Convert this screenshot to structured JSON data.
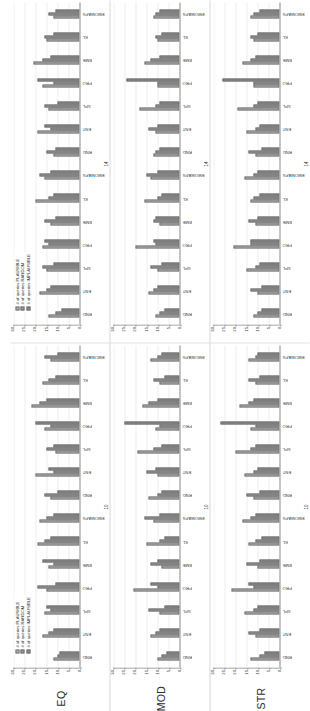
{
  "figure": {
    "legend": {
      "position": "top-left",
      "items": [
        {
          "label": "# of queries PLAUSIBLE",
          "color": "#b9b9b9"
        },
        {
          "label": "# of queries RANDOM",
          "color": "#9a9a9a"
        },
        {
          "label": "# of queries IMPLAUSIBLE",
          "color": "#8d8d8d"
        }
      ]
    },
    "row_labels": [
      "EQ",
      "MOD",
      "STR"
    ],
    "xtitles": [
      "10",
      "14"
    ]
  },
  "chart_data": [
    {
      "id": "eq-left",
      "type": "bar",
      "title": "EQ",
      "xlabel": "10",
      "ylabel": "",
      "ylim": [
        0,
        30
      ],
      "yticks": [
        0,
        5,
        10,
        15,
        20,
        25,
        30
      ],
      "grid": true,
      "legend_position": "top-left",
      "categories": [
        "RND",
        "ENT",
        "SPL",
        "PRO",
        "BME",
        "KL",
        "EMOMAPS",
        "RND",
        "ENT",
        "SPL",
        "PRO",
        "BME",
        "KL",
        "EMOMAPS"
      ],
      "series": [
        {
          "name": "# of queries PLAUSIBLE",
          "values": [
            12,
            17,
            16,
            15,
            14,
            19,
            18,
            13,
            20,
            11,
            16,
            22,
            17,
            13
          ]
        },
        {
          "name": "# of queries RANDOM",
          "values": [
            10,
            14,
            13,
            19,
            12,
            16,
            15,
            16,
            12,
            15,
            13,
            18,
            14,
            16
          ]
        },
        {
          "name": "# of queries IMPLAUSIBLE",
          "values": [
            9,
            12,
            15,
            11,
            17,
            13,
            12,
            10,
            14,
            12,
            20,
            15,
            11,
            10
          ]
        }
      ]
    },
    {
      "id": "eq-right",
      "type": "bar",
      "title": "EQ",
      "xlabel": "14",
      "ylabel": "",
      "ylim": [
        0,
        30
      ],
      "yticks": [
        0,
        5,
        10,
        15,
        20,
        25,
        30
      ],
      "grid": true,
      "legend_position": "top-left",
      "categories": [
        "RND",
        "ENT",
        "SPL",
        "PRO",
        "BME",
        "KL",
        "EMOMAPS",
        "RND",
        "ENT",
        "SPL",
        "PRO",
        "BME",
        "KL",
        "EMOMAPS"
      ],
      "series": [
        {
          "name": "# of queries PLAUSIBLE",
          "values": [
            14,
            18,
            15,
            17,
            13,
            20,
            16,
            12,
            19,
            14,
            17,
            21,
            15,
            12
          ]
        },
        {
          "name": "# of queries RANDOM",
          "values": [
            11,
            15,
            17,
            14,
            16,
            14,
            18,
            15,
            13,
            16,
            12,
            17,
            16,
            14
          ]
        },
        {
          "name": "# of queries IMPLAUSIBLE",
          "values": [
            8,
            13,
            12,
            16,
            11,
            12,
            13,
            11,
            16,
            10,
            19,
            13,
            12,
            11
          ]
        }
      ]
    },
    {
      "id": "mod-left",
      "type": "bar",
      "title": "MOD",
      "xlabel": "10",
      "ylabel": "",
      "ylim": [
        0,
        30
      ],
      "yticks": [
        0,
        5,
        10,
        15,
        20,
        25,
        30
      ],
      "grid": true,
      "legend_position": "none",
      "categories": [
        "RND",
        "ENT",
        "SPL",
        "PRO",
        "BME",
        "KL",
        "EMOMAPS",
        "RND",
        "ENT",
        "SPL",
        "PRO",
        "BME",
        "KL",
        "EMOMAPS"
      ],
      "series": [
        {
          "name": "# of queries PLAUSIBLE",
          "values": [
            10,
            13,
            9,
            21,
            8,
            15,
            12,
            14,
            10,
            19,
            11,
            17,
            9,
            13
          ]
        },
        {
          "name": "# of queries RANDOM",
          "values": [
            8,
            11,
            14,
            10,
            13,
            9,
            16,
            10,
            15,
            12,
            9,
            14,
            12,
            10
          ]
        },
        {
          "name": "# of queries IMPLAUSIBLE",
          "values": [
            6,
            9,
            7,
            13,
            10,
            7,
            9,
            8,
            11,
            8,
            25,
            10,
            7,
            8
          ]
        }
      ]
    },
    {
      "id": "mod-right",
      "type": "bar",
      "title": "MOD",
      "xlabel": "14",
      "ylabel": "",
      "ylim": [
        0,
        30
      ],
      "yticks": [
        0,
        5,
        10,
        15,
        20,
        25,
        30
      ],
      "grid": true,
      "legend_position": "none",
      "categories": [
        "RND",
        "ENT",
        "SPL",
        "PRO",
        "BME",
        "KL",
        "EMOMAPS",
        "RND",
        "ENT",
        "SPL",
        "PRO",
        "BME",
        "KL",
        "EMOMAPS"
      ],
      "series": [
        {
          "name": "# of queries PLAUSIBLE",
          "values": [
            11,
            14,
            10,
            20,
            9,
            16,
            13,
            12,
            11,
            18,
            10,
            16,
            10,
            12
          ]
        },
        {
          "name": "# of queries RANDOM",
          "values": [
            9,
            12,
            13,
            11,
            12,
            10,
            15,
            11,
            14,
            11,
            10,
            13,
            11,
            11
          ]
        },
        {
          "name": "# of queries IMPLAUSIBLE",
          "values": [
            7,
            10,
            8,
            12,
            11,
            8,
            10,
            9,
            10,
            9,
            24,
            9,
            8,
            9
          ]
        }
      ]
    },
    {
      "id": "str-left",
      "type": "bar",
      "title": "STR",
      "xlabel": "10",
      "ylabel": "",
      "ylim": [
        0,
        30
      ],
      "yticks": [
        0,
        5,
        10,
        15,
        20,
        25,
        30
      ],
      "grid": true,
      "legend_position": "none",
      "categories": [
        "RND",
        "ENT",
        "SPL",
        "PRO",
        "BME",
        "KL",
        "EMOMAPS",
        "RND",
        "ENT",
        "SPL",
        "PRO",
        "BME",
        "KL",
        "EMOMAPS"
      ],
      "series": [
        {
          "name": "# of queries PLAUSIBLE",
          "values": [
            13,
            11,
            16,
            22,
            10,
            14,
            17,
            12,
            16,
            20,
            13,
            18,
            11,
            14
          ]
        },
        {
          "name": "# of queries RANDOM",
          "values": [
            9,
            14,
            12,
            12,
            15,
            11,
            13,
            15,
            12,
            13,
            11,
            14,
            14,
            11
          ]
        },
        {
          "name": "# of queries IMPLAUSIBLE",
          "values": [
            7,
            9,
            10,
            14,
            9,
            8,
            11,
            9,
            10,
            11,
            27,
            12,
            9,
            10
          ]
        }
      ]
    },
    {
      "id": "str-right",
      "type": "bar",
      "title": "STR",
      "xlabel": "14",
      "ylabel": "",
      "ylim": [
        0,
        30
      ],
      "yticks": [
        0,
        5,
        10,
        15,
        20,
        25,
        30
      ],
      "grid": true,
      "legend_position": "none",
      "categories": [
        "RND",
        "ENT",
        "SPL",
        "PRO",
        "BME",
        "KL",
        "EMOMAPS",
        "RND",
        "ENT",
        "SPL",
        "PRO",
        "BME",
        "KL",
        "EMOMAPS"
      ],
      "series": [
        {
          "name": "# of queries PLAUSIBLE",
          "values": [
            12,
            10,
            15,
            21,
            11,
            13,
            16,
            11,
            15,
            19,
            12,
            17,
            12,
            13
          ]
        },
        {
          "name": "# of queries RANDOM",
          "values": [
            10,
            13,
            11,
            13,
            14,
            12,
            12,
            14,
            11,
            12,
            12,
            13,
            13,
            12
          ]
        },
        {
          "name": "# of queries IMPLAUSIBLE",
          "values": [
            8,
            8,
            9,
            13,
            10,
            9,
            10,
            8,
            9,
            10,
            26,
            11,
            10,
            9
          ]
        }
      ]
    }
  ]
}
